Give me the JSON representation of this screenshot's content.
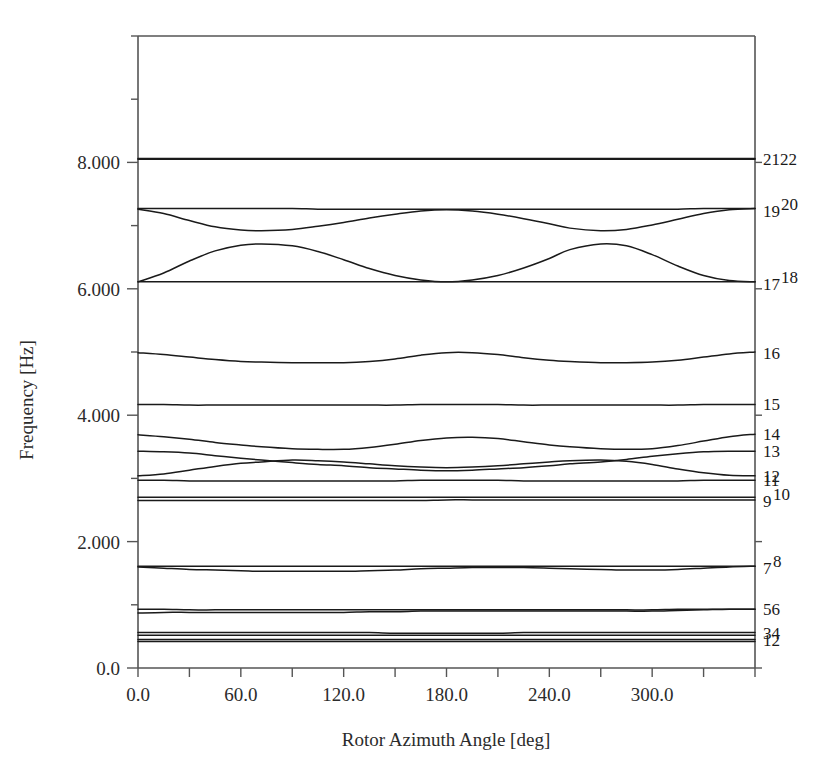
{
  "chart_data": {
    "type": "line",
    "title": "",
    "xlabel": "Rotor Azimuth Angle [deg]",
    "ylabel": "Frequency [Hz]",
    "xlim": [
      0,
      360
    ],
    "ylim": [
      0,
      10.0
    ],
    "grid": false,
    "legend_position": "right-outside-curve-labels",
    "xticks": [
      0,
      60,
      120,
      180,
      240,
      300
    ],
    "xticklabels": [
      "0.0",
      "60.0",
      "120.0",
      "180.0",
      "240.0",
      "300.0"
    ],
    "xminor_step": 30,
    "yticks": [
      0,
      2.0,
      4.0,
      6.0,
      8.0
    ],
    "yticklabels": [
      "0.0",
      "2.000",
      "4.000",
      "6.000",
      "8.000"
    ],
    "yminor_step": 1.0,
    "x": [
      0,
      15,
      30,
      45,
      60,
      72,
      90,
      105,
      120,
      135,
      150,
      165,
      180,
      195,
      210,
      225,
      240,
      252,
      270,
      285,
      300,
      315,
      330,
      345,
      360
    ],
    "series": [
      {
        "name": "1",
        "label": "1",
        "values": [
          0.45,
          0.45,
          0.45,
          0.45,
          0.45,
          0.45,
          0.45,
          0.45,
          0.45,
          0.45,
          0.45,
          0.45,
          0.45,
          0.45,
          0.45,
          0.45,
          0.45,
          0.45,
          0.45,
          0.45,
          0.45,
          0.45,
          0.45,
          0.45,
          0.45
        ]
      },
      {
        "name": "2",
        "label": "2",
        "values": [
          0.42,
          0.42,
          0.42,
          0.42,
          0.42,
          0.42,
          0.42,
          0.42,
          0.42,
          0.42,
          0.42,
          0.42,
          0.42,
          0.42,
          0.42,
          0.42,
          0.42,
          0.42,
          0.42,
          0.42,
          0.42,
          0.42,
          0.42,
          0.42,
          0.42
        ]
      },
      {
        "name": "3",
        "label": "3",
        "values": [
          0.56,
          0.56,
          0.56,
          0.56,
          0.56,
          0.56,
          0.56,
          0.56,
          0.56,
          0.56,
          0.55,
          0.55,
          0.55,
          0.55,
          0.55,
          0.56,
          0.56,
          0.56,
          0.56,
          0.56,
          0.56,
          0.56,
          0.56,
          0.56,
          0.56
        ]
      },
      {
        "name": "4",
        "label": "4",
        "values": [
          0.52,
          0.52,
          0.52,
          0.52,
          0.52,
          0.52,
          0.52,
          0.52,
          0.52,
          0.52,
          0.52,
          0.52,
          0.52,
          0.52,
          0.52,
          0.52,
          0.52,
          0.52,
          0.52,
          0.52,
          0.52,
          0.52,
          0.52,
          0.52,
          0.52
        ]
      },
      {
        "name": "5",
        "label": "5",
        "values": [
          0.93,
          0.93,
          0.92,
          0.92,
          0.92,
          0.92,
          0.92,
          0.92,
          0.92,
          0.92,
          0.92,
          0.92,
          0.92,
          0.92,
          0.92,
          0.92,
          0.92,
          0.92,
          0.92,
          0.92,
          0.92,
          0.93,
          0.93,
          0.93,
          0.93
        ]
      },
      {
        "name": "6",
        "label": "6",
        "values": [
          0.87,
          0.88,
          0.88,
          0.88,
          0.88,
          0.88,
          0.88,
          0.88,
          0.88,
          0.89,
          0.89,
          0.9,
          0.9,
          0.9,
          0.9,
          0.9,
          0.9,
          0.9,
          0.9,
          0.9,
          0.9,
          0.91,
          0.92,
          0.93,
          0.93
        ]
      },
      {
        "name": "7",
        "label": "7",
        "values": [
          1.6,
          1.58,
          1.56,
          1.55,
          1.54,
          1.53,
          1.53,
          1.53,
          1.53,
          1.54,
          1.55,
          1.57,
          1.58,
          1.59,
          1.59,
          1.59,
          1.58,
          1.57,
          1.56,
          1.55,
          1.55,
          1.56,
          1.58,
          1.6,
          1.61
        ]
      },
      {
        "name": "8",
        "label": "8",
        "values": [
          1.61,
          1.61,
          1.61,
          1.61,
          1.61,
          1.61,
          1.61,
          1.61,
          1.61,
          1.61,
          1.61,
          1.61,
          1.61,
          1.61,
          1.61,
          1.61,
          1.61,
          1.61,
          1.61,
          1.61,
          1.61,
          1.61,
          1.61,
          1.61,
          1.61
        ]
      },
      {
        "name": "9",
        "label": "9",
        "values": [
          2.7,
          2.7,
          2.7,
          2.7,
          2.7,
          2.7,
          2.7,
          2.7,
          2.7,
          2.7,
          2.7,
          2.7,
          2.7,
          2.7,
          2.7,
          2.7,
          2.7,
          2.7,
          2.7,
          2.7,
          2.7,
          2.7,
          2.7,
          2.7,
          2.7
        ]
      },
      {
        "name": "10",
        "label": "10",
        "values": [
          2.65,
          2.65,
          2.65,
          2.65,
          2.65,
          2.65,
          2.65,
          2.65,
          2.65,
          2.65,
          2.65,
          2.65,
          2.66,
          2.66,
          2.66,
          2.66,
          2.66,
          2.66,
          2.66,
          2.66,
          2.66,
          2.66,
          2.66,
          2.66,
          2.66
        ]
      },
      {
        "name": "11",
        "label": "11",
        "values": [
          2.97,
          2.97,
          2.96,
          2.96,
          2.96,
          2.96,
          2.96,
          2.96,
          2.96,
          2.96,
          2.96,
          2.97,
          2.97,
          2.97,
          2.97,
          2.96,
          2.96,
          2.96,
          2.96,
          2.96,
          2.96,
          2.96,
          2.97,
          2.97,
          2.97
        ]
      },
      {
        "name": "12",
        "label": "12",
        "values": [
          3.04,
          3.07,
          3.13,
          3.19,
          3.24,
          3.26,
          3.29,
          3.28,
          3.26,
          3.23,
          3.2,
          3.18,
          3.17,
          3.18,
          3.2,
          3.23,
          3.26,
          3.28,
          3.29,
          3.27,
          3.22,
          3.15,
          3.09,
          3.05,
          3.04
        ]
      },
      {
        "name": "13",
        "label": "13",
        "values": [
          3.43,
          3.42,
          3.4,
          3.36,
          3.32,
          3.29,
          3.25,
          3.22,
          3.2,
          3.17,
          3.15,
          3.13,
          3.12,
          3.13,
          3.15,
          3.17,
          3.2,
          3.23,
          3.26,
          3.3,
          3.35,
          3.39,
          3.42,
          3.43,
          3.43
        ]
      },
      {
        "name": "14",
        "label": "14",
        "values": [
          3.69,
          3.66,
          3.62,
          3.57,
          3.53,
          3.5,
          3.47,
          3.46,
          3.46,
          3.49,
          3.54,
          3.6,
          3.64,
          3.65,
          3.63,
          3.58,
          3.53,
          3.5,
          3.47,
          3.46,
          3.47,
          3.52,
          3.59,
          3.66,
          3.7
        ]
      },
      {
        "name": "15",
        "label": "15",
        "values": [
          4.17,
          4.17,
          4.16,
          4.16,
          4.16,
          4.16,
          4.16,
          4.16,
          4.16,
          4.16,
          4.16,
          4.17,
          4.17,
          4.17,
          4.17,
          4.16,
          4.16,
          4.16,
          4.16,
          4.16,
          4.16,
          4.16,
          4.17,
          4.17,
          4.17
        ]
      },
      {
        "name": "16",
        "label": "16",
        "values": [
          4.99,
          4.96,
          4.92,
          4.88,
          4.85,
          4.84,
          4.83,
          4.83,
          4.83,
          4.85,
          4.89,
          4.95,
          4.99,
          4.99,
          4.96,
          4.91,
          4.87,
          4.85,
          4.83,
          4.83,
          4.84,
          4.87,
          4.92,
          4.97,
          5.0
        ]
      },
      {
        "name": "17",
        "label": "17",
        "values": [
          6.11,
          6.25,
          6.44,
          6.6,
          6.69,
          6.71,
          6.68,
          6.59,
          6.46,
          6.32,
          6.21,
          6.14,
          6.11,
          6.14,
          6.21,
          6.33,
          6.48,
          6.62,
          6.71,
          6.68,
          6.54,
          6.36,
          6.21,
          6.13,
          6.11
        ]
      },
      {
        "name": "18",
        "label": "18",
        "values": [
          6.11,
          6.11,
          6.11,
          6.11,
          6.11,
          6.11,
          6.11,
          6.11,
          6.11,
          6.11,
          6.11,
          6.11,
          6.11,
          6.11,
          6.11,
          6.11,
          6.11,
          6.11,
          6.11,
          6.11,
          6.11,
          6.11,
          6.11,
          6.11,
          6.11
        ]
      },
      {
        "name": "19",
        "label": "19",
        "values": [
          7.26,
          7.19,
          7.08,
          6.98,
          6.93,
          6.92,
          6.94,
          6.99,
          7.05,
          7.12,
          7.18,
          7.23,
          7.25,
          7.23,
          7.18,
          7.11,
          7.03,
          6.96,
          6.92,
          6.94,
          7.01,
          7.1,
          7.19,
          7.25,
          7.27
        ]
      },
      {
        "name": "20",
        "label": "20",
        "values": [
          7.27,
          7.27,
          7.27,
          7.27,
          7.27,
          7.27,
          7.27,
          7.26,
          7.26,
          7.26,
          7.26,
          7.26,
          7.26,
          7.26,
          7.26,
          7.26,
          7.26,
          7.26,
          7.26,
          7.26,
          7.26,
          7.26,
          7.27,
          7.27,
          7.27
        ]
      },
      {
        "name": "21",
        "label": "21",
        "values": [
          8.06,
          8.06,
          8.06,
          8.06,
          8.06,
          8.06,
          8.06,
          8.06,
          8.06,
          8.06,
          8.06,
          8.06,
          8.06,
          8.06,
          8.06,
          8.06,
          8.06,
          8.06,
          8.06,
          8.06,
          8.06,
          8.06,
          8.06,
          8.06,
          8.06
        ]
      },
      {
        "name": "22",
        "label": "22",
        "values": [
          8.05,
          8.05,
          8.05,
          8.05,
          8.05,
          8.05,
          8.05,
          8.05,
          8.05,
          8.05,
          8.05,
          8.05,
          8.05,
          8.05,
          8.05,
          8.05,
          8.05,
          8.05,
          8.05,
          8.05,
          8.05,
          8.05,
          8.05,
          8.05,
          8.05
        ]
      }
    ],
    "curve_labels": [
      {
        "text": "2122",
        "parts": [
          "21",
          "22"
        ],
        "y_value": 8.06,
        "style": "pair-level"
      },
      {
        "text": "19 20",
        "parts": [
          "19",
          "20"
        ],
        "y_value": 7.27,
        "style": "pair-raised"
      },
      {
        "text": "17 18",
        "parts": [
          "17",
          "18"
        ],
        "y_value": 6.11,
        "style": "pair-raised"
      },
      {
        "text": "16",
        "parts": [
          "16"
        ],
        "y_value": 4.99,
        "style": "single"
      },
      {
        "text": "15",
        "parts": [
          "15"
        ],
        "y_value": 4.17,
        "style": "single"
      },
      {
        "text": "14",
        "parts": [
          "14"
        ],
        "y_value": 3.7,
        "style": "single"
      },
      {
        "text": "13",
        "parts": [
          "13"
        ],
        "y_value": 3.43,
        "style": "single"
      },
      {
        "text": "12",
        "parts": [
          "12"
        ],
        "y_value": 3.04,
        "style": "single"
      },
      {
        "text": "11",
        "parts": [
          "11"
        ],
        "y_value": 2.97,
        "style": "single"
      },
      {
        "text": "9 10",
        "parts": [
          "9",
          "10"
        ],
        "y_value": 2.68,
        "style": "pair-raised"
      },
      {
        "text": "7 8",
        "parts": [
          "7",
          "8"
        ],
        "y_value": 1.61,
        "style": "pair-raised"
      },
      {
        "text": "56",
        "parts": [
          "5",
          "6"
        ],
        "y_value": 0.93,
        "style": "pair-level"
      },
      {
        "text": "34",
        "parts": [
          "3",
          "4"
        ],
        "y_value": 0.56,
        "style": "pair-level"
      },
      {
        "text": "12",
        "parts": [
          "1",
          "2"
        ],
        "y_value": 0.45,
        "style": "pair-level"
      }
    ],
    "line_color": "#1a1a1a",
    "axis_color": "#555555",
    "background": "#ffffff"
  }
}
